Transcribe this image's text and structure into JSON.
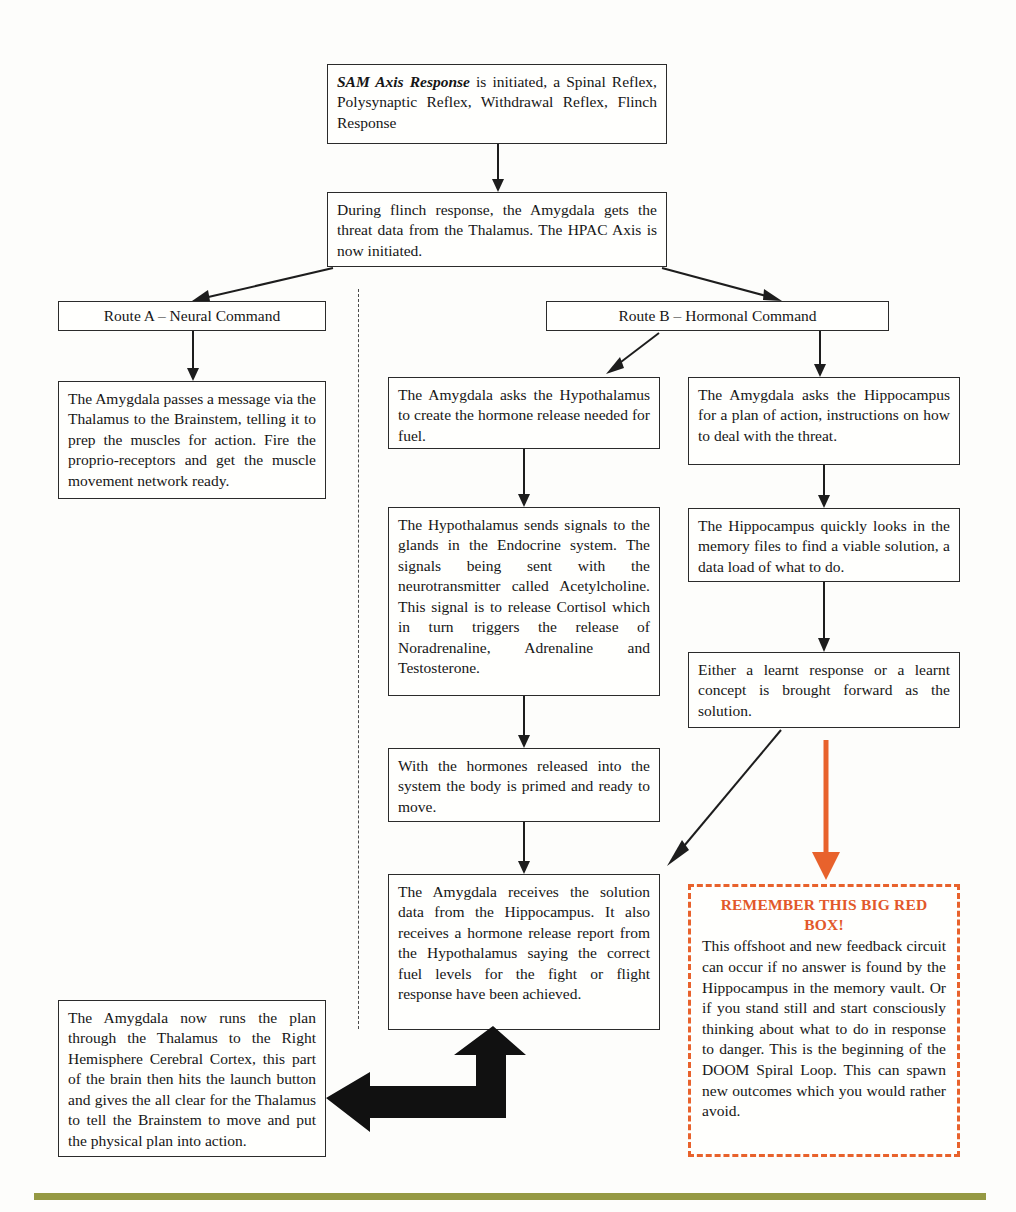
{
  "diagram": {
    "colors": {
      "box_border": "#2b2b2b",
      "red_accent": "#e2582a",
      "orange_arrow": "#e8622c",
      "footer_rule": "#8c9033",
      "text": "#161616"
    }
  },
  "nodes": {
    "sam_axis": {
      "lead": "SAM Axis Response",
      "rest": " is initiated, a Spinal Reflex, Polysynaptic Reflex, Withdrawal Reflex, Flinch Response"
    },
    "flinch_amygdala": "During flinch response, the Amygdala gets the threat data from the Thalamus. The HPAC Axis is now initiated.",
    "route_a_header": "Route A – Neural Command",
    "route_b_header": "Route B – Hormonal Command",
    "route_a_body": "The Amygdala passes a message via the Thalamus to the Brainstem, telling it to prep the muscles for action. Fire the proprio-receptors and get the muscle movement network ready.",
    "amygdala_asks_hypothalamus": "The Amygdala asks the Hypothalamus to create the hormone release needed for fuel.",
    "hypothalamus_signals": "The Hypothalamus sends signals to the glands in the Endocrine system. The signals being sent with the neurotransmitter called Acetylcholine. This signal is to release Cortisol which in turn triggers the release of Noradrenaline, Adrenaline and Testosterone.",
    "hormones_released": "With the hormones released into the system the body is primed and ready to move.",
    "amygdala_receives": "The Amygdala receives the solution data from the Hippocampus. It also receives a hormone release report from the Hypothalamus saying the correct fuel levels for the fight or flight response have been achieved.",
    "amygdala_asks_hippocampus": "The Amygdala asks the Hippocampus for a plan of action, instructions on how to deal with the threat.",
    "hippocampus_looks": "The Hippocampus quickly looks in the memory files to find a viable solution, a data load of what to do.",
    "learnt_response": "Either a learnt response or a learnt concept is brought forward as the solution.",
    "amygdala_runs_plan": "The Amygdala now runs the plan through the Thalamus to the Right Hemisphere Cerebral Cortex, this part of the brain then hits the launch button and gives the all clear for the Thalamus to tell the Brainstem to move and put the physical plan into action.",
    "red_box": {
      "title": "REMEMBER THIS BIG RED BOX!",
      "body": "This offshoot and new feedback circuit can occur if no answer is found by the Hippocampus in the memory vault. Or if you stand still and start consciously thinking about what to do in response to danger. This is the beginning of the DOOM Spiral Loop. This can spawn new outcomes which you would rather avoid."
    }
  }
}
